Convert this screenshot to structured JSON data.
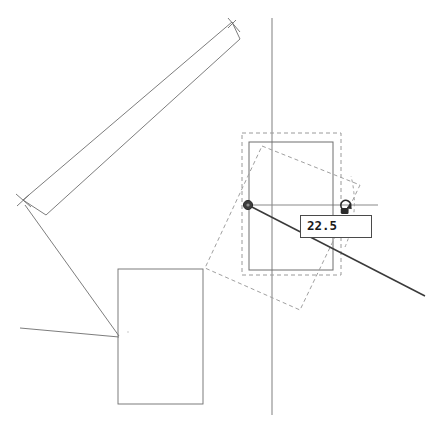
{
  "app": {
    "title": "CAD Rotate Tool Canvas",
    "background_color": "#ffffff"
  },
  "colors": {
    "geometry_stroke": "#6e6e6e",
    "axis_stroke": "#8a8a8a",
    "ghost_dashed": "#a0a0a0",
    "selection_dashed": "#9a9a9a",
    "drag_line": "#3a3a3a",
    "pivot_fill": "#3d3d3d",
    "label_border": "#4a4a4a",
    "label_background": "#ffffff",
    "label_text": "#1a1a1a",
    "cursor_stroke": "#2b2b2b"
  },
  "readout": {
    "name": "angle-readout",
    "value": "22.5",
    "unit_implied": "degrees"
  },
  "cursor": {
    "name": "rotate-cursor-icon",
    "kind": "rotate"
  },
  "pivot": {
    "name": "rotation-pivot-handle",
    "x": 248,
    "y": 205,
    "radius": 4.5
  },
  "axes": {
    "vertical": {
      "name": "vertical-axis-line",
      "x": 272,
      "y1": 18,
      "y2": 415
    },
    "horizontal": {
      "name": "horizontal-reference-line",
      "y": 205,
      "x1": 248,
      "x2": 378
    }
  },
  "drag_line": {
    "name": "rotation-drag-line",
    "x1": 248,
    "y1": 205,
    "x2": 425,
    "y2": 296
  },
  "shapes": [
    {
      "name": "selected-rectangle",
      "style": "solid",
      "x": 249,
      "y": 142,
      "width": 84,
      "height": 128
    },
    {
      "name": "selection-bounding-box",
      "style": "dashed",
      "x": 242,
      "y": 133,
      "width": 99,
      "height": 142
    },
    {
      "name": "rotation-ghost-rectangle",
      "style": "dashed",
      "points": "262,146 360,185 300,310 205,268"
    },
    {
      "name": "angle-arc-indicator",
      "style": "dashed",
      "points": "345,247 357,210 352,176"
    },
    {
      "name": "diagonal-bar-outline",
      "style": "solid",
      "points": "23,200 232,22 240,39 46,215"
    },
    {
      "name": "bar-tick-upper-right",
      "style": "solid",
      "points": "228,18 240,32"
    },
    {
      "name": "bar-tick-lower-left",
      "style": "solid",
      "points": "17,195 32,207"
    },
    {
      "name": "bottom-rectangle",
      "style": "solid",
      "x": 118,
      "y": 269,
      "width": 85,
      "height": 135
    },
    {
      "name": "leader-line-from-bar",
      "style": "solid",
      "points": "25,205 119,336"
    },
    {
      "name": "leader-line-horizontal",
      "style": "solid",
      "points": "20,328 119,337"
    }
  ]
}
